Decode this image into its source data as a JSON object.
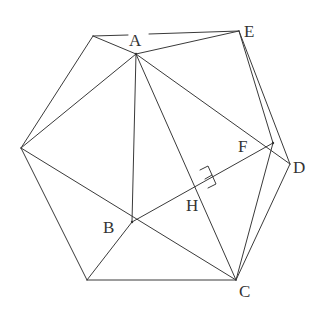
{
  "diagram": {
    "type": "geometry",
    "stroke_color": "#3a3a3a",
    "points": {
      "P1": {
        "x": 93,
        "y": 36,
        "label": ""
      },
      "A": {
        "x": 136,
        "y": 54,
        "label": "A"
      },
      "E": {
        "x": 239,
        "y": 31,
        "label": "E"
      },
      "L": {
        "x": 21,
        "y": 148,
        "label": ""
      },
      "F": {
        "x": 273,
        "y": 143,
        "label": "F"
      },
      "D": {
        "x": 290,
        "y": 164,
        "label": "D"
      },
      "H": {
        "x": 205,
        "y": 181,
        "label": "H"
      },
      "B": {
        "x": 132,
        "y": 222,
        "label": "B"
      },
      "BL": {
        "x": 87,
        "y": 280,
        "label": ""
      },
      "C": {
        "x": 236,
        "y": 280,
        "label": "C"
      }
    },
    "labels": [
      {
        "text": "A",
        "x": 129,
        "y": 46
      },
      {
        "text": "E",
        "x": 244,
        "y": 37
      },
      {
        "text": "F",
        "x": 238,
        "y": 152
      },
      {
        "text": "D",
        "x": 293,
        "y": 173
      },
      {
        "text": "H",
        "x": 186,
        "y": 211
      },
      {
        "text": "B",
        "x": 103,
        "y": 233
      },
      {
        "text": "C",
        "x": 239,
        "y": 297
      }
    ],
    "segments": [
      [
        "P1",
        "E"
      ],
      [
        "P1",
        "A"
      ],
      [
        "A",
        "E"
      ],
      [
        "P1",
        "L"
      ],
      [
        "L",
        "A"
      ],
      [
        "A",
        "B"
      ],
      [
        "A",
        "D"
      ],
      [
        "A",
        "C"
      ],
      [
        "L",
        "C"
      ],
      [
        "L",
        "BL"
      ],
      [
        "BL",
        "B"
      ],
      [
        "BL",
        "C"
      ],
      [
        "B",
        "F"
      ],
      [
        "F",
        "C"
      ],
      [
        "D",
        "C"
      ],
      [
        "E",
        "F"
      ],
      [
        "E",
        "D"
      ]
    ],
    "right_angle_marker": {
      "at": "H",
      "between": [
        "A",
        "F"
      ]
    }
  }
}
